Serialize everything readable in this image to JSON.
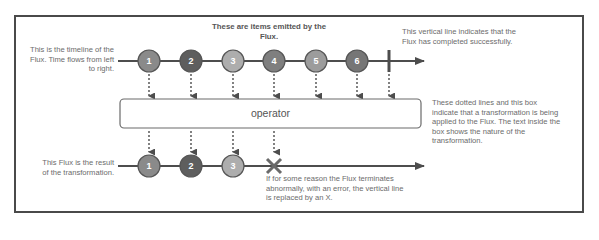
{
  "notes": {
    "top_timeline": "This is the timeline of the Flux. Time flows from left to right.",
    "emitted_items": "These are items emitted by the Flux.",
    "completion": "This vertical line indicates that the Flux has completed successfully.",
    "operator_explanation": "These dotted lines and this box indicate that a transformation is being applied to the Flux. The text inside the box shows the nature of the transformation.",
    "result_timeline": "This Flux is the result of the transformation.",
    "error": "If for some reason the Flux terminates abnormally, with an error, the vertical line is replaced by an X."
  },
  "operator": {
    "label": "operator"
  },
  "source_flux": {
    "items": [
      {
        "label": "1",
        "color": "#8a8a8a"
      },
      {
        "label": "2",
        "color": "#5e5e5e"
      },
      {
        "label": "3",
        "color": "#adadad"
      },
      {
        "label": "4",
        "color": "#7f7f7f"
      },
      {
        "label": "5",
        "color": "#9c9c9c"
      },
      {
        "label": "6",
        "color": "#767676"
      }
    ],
    "terminal": "completion-bar"
  },
  "result_flux": {
    "items": [
      {
        "label": "1",
        "color": "#8a8a8a"
      },
      {
        "label": "2",
        "color": "#5e5e5e"
      },
      {
        "label": "3",
        "color": "#adadad"
      }
    ],
    "terminal": "error-x"
  },
  "colors": {
    "line": "#4d4d4d",
    "frame": "#4a4a4a",
    "text": "#6b6b6b",
    "marble_stroke": "#555555"
  }
}
